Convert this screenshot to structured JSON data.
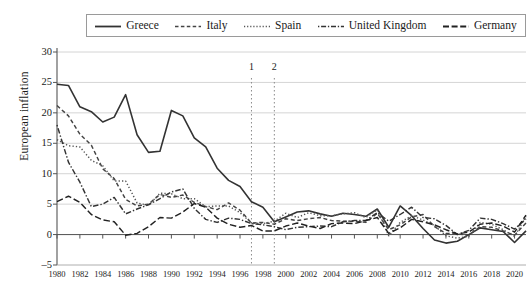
{
  "legend": {
    "position": "top",
    "entries": [
      {
        "label": "Greece",
        "style": "solid",
        "color": "#333333"
      },
      {
        "label": "Italy",
        "style": "dashed",
        "color": "#444444"
      },
      {
        "label": "Spain",
        "style": "dotted",
        "color": "#555555"
      },
      {
        "label": "United Kingdom",
        "style": "dashdot",
        "color": "#333333"
      },
      {
        "label": "Germany",
        "style": "longdash",
        "color": "#222222"
      }
    ]
  },
  "axes": {
    "ylabel": "European inflation",
    "yticks": [
      30,
      25,
      20,
      15,
      10,
      5,
      0,
      -5
    ],
    "ylim": [
      -5,
      30
    ],
    "xticks": [
      1980,
      1982,
      1984,
      1986,
      1988,
      1990,
      1992,
      1994,
      1996,
      1998,
      2000,
      2002,
      2004,
      2006,
      2008,
      2010,
      2012,
      2014,
      2016,
      2018,
      2020
    ],
    "xlim": [
      1980,
      2021
    ],
    "grid": "horizontal"
  },
  "annotations": [
    {
      "name": "1",
      "x": 1997
    },
    {
      "name": "2",
      "x": 1999
    }
  ],
  "chart_data": {
    "type": "line",
    "title": "",
    "xlabel": "",
    "ylabel": "European inflation",
    "ylim": [
      -5,
      30
    ],
    "xlim": [
      1980,
      2021
    ],
    "grid": true,
    "legend_position": "top",
    "x": [
      1980,
      1981,
      1982,
      1983,
      1984,
      1985,
      1986,
      1987,
      1988,
      1989,
      1990,
      1991,
      1992,
      1993,
      1994,
      1995,
      1996,
      1997,
      1998,
      1999,
      2000,
      2001,
      2002,
      2003,
      2004,
      2005,
      2006,
      2007,
      2008,
      2009,
      2010,
      2011,
      2012,
      2013,
      2014,
      2015,
      2016,
      2017,
      2018,
      2019,
      2020,
      2021
    ],
    "series": [
      {
        "name": "Greece",
        "style": "solid",
        "color": "#333333",
        "values": [
          24.7,
          24.5,
          21.0,
          20.2,
          18.5,
          19.3,
          23.0,
          16.4,
          13.5,
          13.7,
          20.4,
          19.5,
          15.9,
          14.4,
          10.9,
          8.9,
          7.9,
          5.4,
          4.5,
          2.1,
          2.9,
          3.7,
          3.9,
          3.4,
          3.0,
          3.5,
          3.3,
          3.0,
          4.2,
          1.2,
          4.7,
          3.1,
          1.0,
          -0.9,
          -1.4,
          -1.1,
          0.0,
          1.1,
          0.8,
          0.5,
          -1.3,
          0.6
        ]
      },
      {
        "name": "Italy",
        "style": "dashed",
        "color": "#444444",
        "values": [
          21.2,
          19.5,
          16.5,
          14.7,
          10.8,
          9.2,
          5.8,
          4.7,
          5.0,
          6.6,
          6.1,
          6.5,
          5.3,
          4.6,
          4.1,
          5.2,
          4.0,
          1.9,
          2.0,
          1.7,
          2.6,
          2.3,
          2.6,
          2.8,
          2.3,
          2.2,
          2.2,
          2.0,
          3.5,
          0.8,
          1.6,
          2.9,
          3.3,
          1.3,
          0.2,
          0.1,
          -0.1,
          1.3,
          1.2,
          0.6,
          -0.1,
          1.9
        ]
      },
      {
        "name": "Spain",
        "style": "dotted",
        "color": "#555555",
        "values": [
          15.6,
          14.6,
          14.4,
          12.2,
          11.3,
          8.8,
          8.8,
          5.2,
          4.8,
          6.8,
          6.7,
          5.9,
          5.9,
          4.6,
          4.7,
          4.7,
          3.6,
          1.9,
          1.8,
          2.2,
          3.5,
          2.8,
          3.6,
          3.1,
          3.1,
          3.4,
          3.6,
          2.8,
          4.1,
          -0.2,
          2.0,
          3.1,
          2.4,
          1.5,
          -0.2,
          -0.6,
          -0.3,
          2.0,
          1.7,
          0.8,
          -0.3,
          3.0
        ]
      },
      {
        "name": "United Kingdom",
        "style": "dashdot",
        "color": "#333333",
        "values": [
          18.0,
          11.9,
          8.6,
          4.6,
          5.0,
          6.1,
          3.4,
          4.2,
          4.9,
          5.9,
          7.0,
          7.5,
          4.3,
          2.5,
          2.0,
          2.7,
          2.5,
          1.8,
          1.6,
          1.3,
          0.8,
          1.2,
          1.3,
          1.4,
          1.3,
          2.1,
          2.3,
          2.3,
          3.6,
          2.2,
          3.3,
          4.5,
          2.8,
          2.6,
          1.5,
          0.0,
          0.7,
          2.7,
          2.5,
          1.8,
          0.9,
          2.6
        ]
      },
      {
        "name": "Germany",
        "style": "longdash",
        "color": "#222222",
        "values": [
          5.4,
          6.3,
          5.3,
          3.3,
          2.4,
          2.1,
          -0.1,
          0.2,
          1.3,
          2.8,
          2.7,
          3.7,
          5.1,
          4.5,
          2.7,
          1.7,
          1.2,
          1.5,
          0.6,
          0.6,
          1.4,
          1.9,
          1.4,
          1.0,
          1.8,
          1.9,
          1.8,
          2.3,
          2.8,
          0.2,
          1.1,
          2.5,
          2.1,
          1.6,
          0.8,
          0.1,
          0.4,
          1.7,
          1.9,
          1.4,
          0.4,
          3.2
        ]
      }
    ]
  }
}
